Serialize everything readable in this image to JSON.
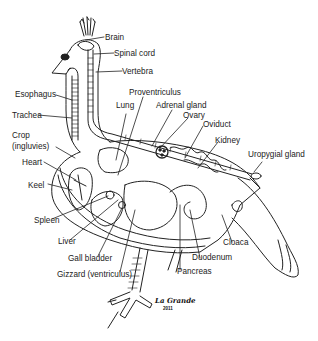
{
  "diagram": {
    "labels": {
      "brain": "Brain",
      "spinal_cord": "Spinal cord",
      "vertebra": "Vertebra",
      "esophagus": "Esophagus",
      "trachea": "Trachea",
      "crop": "Crop",
      "crop_alt": "(ingluvies)",
      "heart": "Heart",
      "keel": "Keel",
      "spleen": "Spleen",
      "liver": "Liver",
      "gall_bladder": "Gall bladder",
      "gizzard": "Gizzard (ventriculus)",
      "proventriculus": "Proventriculus",
      "lung": "Lung",
      "adrenal_gland": "Adrenal gland",
      "ovary": "Ovary",
      "oviduct": "Oviduct",
      "kidney": "Kidney",
      "uropygial_gland": "Uropygial gland",
      "cloaca": "Cloaca",
      "duodenum": "Duodenum",
      "pancreas": "Pancreas"
    },
    "signature": "La Grande",
    "signature_year": "2011"
  }
}
